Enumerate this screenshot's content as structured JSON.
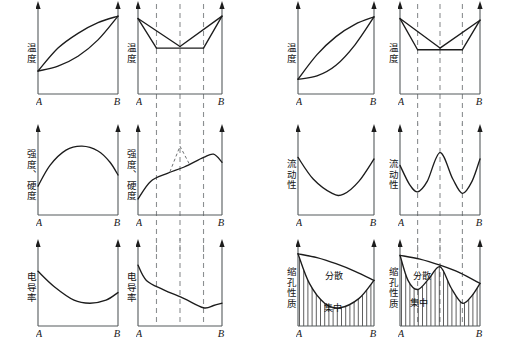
{
  "figure": {
    "title": "",
    "background_color": "#ffffff",
    "axis_color": "#555a5c",
    "curve_color": "#1c1c1c",
    "dashline_color": "#8c8f91",
    "columns": 4,
    "rows": 3
  },
  "axis_labels": {
    "left_end": "A",
    "right_end": "B"
  },
  "panels": [
    {
      "id": "p1",
      "row": 1,
      "col": 1,
      "ylabel": "温度",
      "xleft": "A",
      "xright": "B",
      "chart_data": {
        "type": "line",
        "title": "",
        "xlabel": "",
        "ylabel": "温度",
        "series": [
          {
            "name": "液相线",
            "x": [
              0,
              0.25,
              0.5,
              0.75,
              1
            ],
            "values": [
              0.28,
              0.56,
              0.74,
              0.87,
              0.95
            ]
          },
          {
            "name": "固相线",
            "x": [
              0,
              0.25,
              0.5,
              0.75,
              1
            ],
            "values": [
              0.28,
              0.34,
              0.46,
              0.66,
              0.95
            ]
          }
        ],
        "xlim": [
          0,
          1
        ],
        "ylim": [
          0,
          1
        ],
        "grid": false,
        "legend": "none"
      }
    },
    {
      "id": "p2",
      "row": 1,
      "col": 2,
      "ylabel": "温度",
      "xleft": "A",
      "xright": "B",
      "dash_positions": [
        0.22,
        0.5,
        0.78
      ],
      "chart_data": {
        "type": "line",
        "title": "",
        "xlabel": "",
        "ylabel": "温度",
        "series": [
          {
            "name": "液相线左支",
            "x": [
              0,
              0.5
            ],
            "values": [
              0.92,
              0.58
            ]
          },
          {
            "name": "液相线右支",
            "x": [
              0.5,
              1
            ],
            "values": [
              0.58,
              0.95
            ]
          },
          {
            "name": "固相线左",
            "x": [
              0,
              0.22
            ],
            "values": [
              0.92,
              0.56
            ]
          },
          {
            "name": "固相线右",
            "x": [
              0.78,
              1
            ],
            "values": [
              0.56,
              0.95
            ]
          },
          {
            "name": "共晶水平线",
            "x": [
              0.22,
              0.78
            ],
            "values": [
              0.56,
              0.56
            ]
          }
        ],
        "xlim": [
          0,
          1
        ],
        "ylim": [
          0,
          1
        ],
        "grid": false,
        "legend": "none"
      }
    },
    {
      "id": "p3",
      "row": 1,
      "col": 3,
      "ylabel": "温度",
      "xleft": "A",
      "xright": "B",
      "chart_data": {
        "type": "line",
        "title": "",
        "xlabel": "",
        "ylabel": "温度",
        "series": [
          {
            "name": "液相线",
            "x": [
              0,
              0.25,
              0.5,
              0.75,
              1
            ],
            "values": [
              0.18,
              0.48,
              0.7,
              0.85,
              0.94
            ]
          },
          {
            "name": "固相线",
            "x": [
              0,
              0.25,
              0.5,
              0.75,
              1
            ],
            "values": [
              0.18,
              0.22,
              0.35,
              0.6,
              0.94
            ]
          }
        ],
        "xlim": [
          0,
          1
        ],
        "ylim": [
          0,
          1
        ],
        "grid": false,
        "legend": "none"
      }
    },
    {
      "id": "p4",
      "row": 1,
      "col": 4,
      "ylabel": "温度",
      "xleft": "A",
      "xright": "B",
      "dash_positions": [
        0.22,
        0.5,
        0.78
      ],
      "chart_data": {
        "type": "line",
        "title": "",
        "xlabel": "",
        "ylabel": "温度",
        "series": [
          {
            "name": "液相线左支",
            "x": [
              0,
              0.5
            ],
            "values": [
              0.92,
              0.56
            ]
          },
          {
            "name": "液相线右支",
            "x": [
              0.5,
              1
            ],
            "values": [
              0.56,
              0.9
            ]
          },
          {
            "name": "固相线左",
            "x": [
              0,
              0.22
            ],
            "values": [
              0.92,
              0.54
            ]
          },
          {
            "name": "固相线右",
            "x": [
              0.78,
              1
            ],
            "values": [
              0.54,
              0.9
            ]
          },
          {
            "name": "共晶水平线",
            "x": [
              0.22,
              0.78
            ],
            "values": [
              0.54,
              0.54
            ]
          }
        ],
        "xlim": [
          0,
          1
        ],
        "ylim": [
          0,
          1
        ],
        "grid": false,
        "legend": "none"
      }
    },
    {
      "id": "p5",
      "row": 2,
      "col": 1,
      "ylabel": "强度、硬度",
      "xleft": "A",
      "xright": "B",
      "chart_data": {
        "type": "line",
        "title": "",
        "xlabel": "",
        "ylabel": "强度、硬度",
        "series": [
          {
            "name": "强度硬度",
            "x": [
              0,
              0.15,
              0.35,
              0.55,
              0.75,
              0.9,
              1
            ],
            "values": [
              0.36,
              0.62,
              0.81,
              0.86,
              0.8,
              0.66,
              0.5
            ]
          }
        ],
        "xlim": [
          0,
          1
        ],
        "ylim": [
          0,
          1
        ],
        "grid": false,
        "legend": "none"
      }
    },
    {
      "id": "p6",
      "row": 2,
      "col": 2,
      "ylabel": "强度、硬度",
      "xleft": "A",
      "xright": "B",
      "dash_positions": [
        0.22,
        0.5,
        0.78
      ],
      "annotation_peak": {
        "at_x": 0.5,
        "style": "dashed-triangle"
      },
      "chart_data": {
        "type": "line",
        "title": "",
        "xlabel": "",
        "ylabel": "强度、硬度",
        "series": [
          {
            "name": "强度硬度",
            "x": [
              0,
              0.15,
              0.35,
              0.55,
              0.78,
              0.9,
              1
            ],
            "values": [
              0.2,
              0.42,
              0.52,
              0.6,
              0.72,
              0.76,
              0.66
            ]
          },
          {
            "name": "异常尖峰(虚线)",
            "x": [
              0.38,
              0.5,
              0.62
            ],
            "values": [
              0.54,
              0.86,
              0.62
            ]
          }
        ],
        "xlim": [
          0,
          1
        ],
        "ylim": [
          0,
          1
        ],
        "grid": false,
        "legend": "none"
      }
    },
    {
      "id": "p7",
      "row": 2,
      "col": 3,
      "ylabel": "流动性",
      "xleft": "A",
      "xright": "B",
      "chart_data": {
        "type": "line",
        "title": "",
        "xlabel": "",
        "ylabel": "流动性",
        "series": [
          {
            "name": "流动性",
            "x": [
              0,
              0.2,
              0.45,
              0.6,
              0.8,
              1
            ],
            "values": [
              0.72,
              0.45,
              0.27,
              0.26,
              0.42,
              0.7
            ]
          }
        ],
        "xlim": [
          0,
          1
        ],
        "ylim": [
          0,
          1
        ],
        "grid": false,
        "legend": "none"
      }
    },
    {
      "id": "p8",
      "row": 2,
      "col": 4,
      "ylabel": "流动性",
      "xleft": "A",
      "xright": "B",
      "dash_positions": [
        0.22,
        0.5,
        0.78
      ],
      "chart_data": {
        "type": "line",
        "title": "",
        "xlabel": "",
        "ylabel": "流动性",
        "series": [
          {
            "name": "流动性",
            "x": [
              0,
              0.12,
              0.22,
              0.34,
              0.5,
              0.66,
              0.78,
              0.9,
              1
            ],
            "values": [
              0.62,
              0.38,
              0.29,
              0.42,
              0.78,
              0.45,
              0.27,
              0.42,
              0.7
            ]
          }
        ],
        "xlim": [
          0,
          1
        ],
        "ylim": [
          0,
          1
        ],
        "grid": false,
        "legend": "none"
      }
    },
    {
      "id": "p9",
      "row": 3,
      "col": 1,
      "ylabel": "电导率",
      "xleft": "A",
      "xright": "B",
      "chart_data": {
        "type": "line",
        "title": "",
        "xlabel": "",
        "ylabel": "电导率",
        "series": [
          {
            "name": "电导率",
            "x": [
              0,
              0.2,
              0.45,
              0.65,
              0.85,
              1
            ],
            "values": [
              0.72,
              0.52,
              0.34,
              0.3,
              0.34,
              0.44
            ]
          }
        ],
        "xlim": [
          0,
          1
        ],
        "ylim": [
          0,
          1
        ],
        "grid": false,
        "legend": "none"
      }
    },
    {
      "id": "p10",
      "row": 3,
      "col": 2,
      "ylabel": "电导率",
      "xleft": "A",
      "xright": "B",
      "dash_positions": [
        0.22,
        0.5,
        0.78
      ],
      "chart_data": {
        "type": "line",
        "title": "",
        "xlabel": "",
        "ylabel": "电导率",
        "series": [
          {
            "name": "电导率",
            "x": [
              0,
              0.1,
              0.3,
              0.55,
              0.78,
              0.9,
              1
            ],
            "values": [
              0.8,
              0.6,
              0.48,
              0.36,
              0.24,
              0.27,
              0.3
            ]
          }
        ],
        "xlim": [
          0,
          1
        ],
        "ylim": [
          0,
          1
        ],
        "grid": false,
        "legend": "none"
      }
    },
    {
      "id": "p11",
      "row": 3,
      "col": 3,
      "ylabel": "缩孔性质",
      "xleft": "A",
      "xright": "B",
      "region_labels": [
        {
          "text": "分散",
          "x": 0.48,
          "y": 0.62
        },
        {
          "text": "集中",
          "x": 0.46,
          "y": 0.2
        }
      ],
      "chart_data": {
        "type": "area",
        "title": "",
        "xlabel": "",
        "ylabel": "缩孔性质",
        "series": [
          {
            "name": "上边界(总缩孔)",
            "x": [
              0,
              0.25,
              0.5,
              0.75,
              1
            ],
            "values": [
              0.95,
              0.9,
              0.82,
              0.72,
              0.6
            ]
          },
          {
            "name": "下边界(集中缩孔)",
            "x": [
              0,
              0.15,
              0.35,
              0.55,
              0.8,
              1
            ],
            "values": [
              0.95,
              0.56,
              0.3,
              0.24,
              0.36,
              0.6
            ]
          }
        ],
        "xlim": [
          0,
          1
        ],
        "ylim": [
          0,
          1
        ],
        "grid": false,
        "legend": "none",
        "hatch_region": "below-lower-curve"
      }
    },
    {
      "id": "p12",
      "row": 3,
      "col": 4,
      "ylabel": "缩孔性质",
      "xleft": "A",
      "xright": "B",
      "dash_positions": [
        0.22,
        0.5,
        0.78
      ],
      "region_labels": [
        {
          "text": "分散",
          "x": 0.28,
          "y": 0.62
        },
        {
          "text": "集中",
          "x": 0.24,
          "y": 0.26
        }
      ],
      "chart_data": {
        "type": "area",
        "title": "",
        "xlabel": "",
        "ylabel": "缩孔性质",
        "series": [
          {
            "name": "上边界(总缩孔)",
            "x": [
              0,
              0.25,
              0.5,
              0.75,
              1
            ],
            "values": [
              0.93,
              0.88,
              0.8,
              0.7,
              0.56
            ]
          },
          {
            "name": "下边界(集中缩孔)",
            "x": [
              0,
              0.1,
              0.22,
              0.36,
              0.5,
              0.64,
              0.78,
              0.9,
              1
            ],
            "values": [
              0.93,
              0.6,
              0.48,
              0.62,
              0.78,
              0.5,
              0.3,
              0.4,
              0.56
            ]
          }
        ],
        "xlim": [
          0,
          1
        ],
        "ylim": [
          0,
          1
        ],
        "grid": false,
        "legend": "none",
        "hatch_region": "below-lower-curve"
      }
    }
  ]
}
